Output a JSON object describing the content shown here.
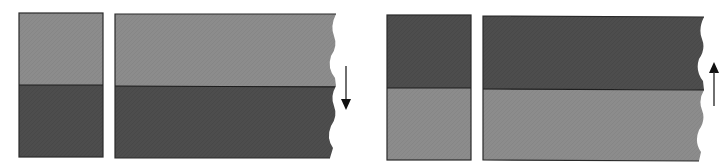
{
  "colors": {
    "background": "#ffffff",
    "light_layer": "#8c8c8c",
    "dark_layer": "#4d4d4d",
    "outline": "#2a2a2a",
    "arrow": "#111111"
  },
  "panels": [
    {
      "id": "left",
      "top_layer": "light",
      "bottom_layer": "dark",
      "arrow_direction": "down",
      "arrow_icon": "arrow-down-icon"
    },
    {
      "id": "right",
      "top_layer": "dark",
      "bottom_layer": "light",
      "arrow_direction": "up",
      "arrow_icon": "arrow-up-icon"
    }
  ]
}
